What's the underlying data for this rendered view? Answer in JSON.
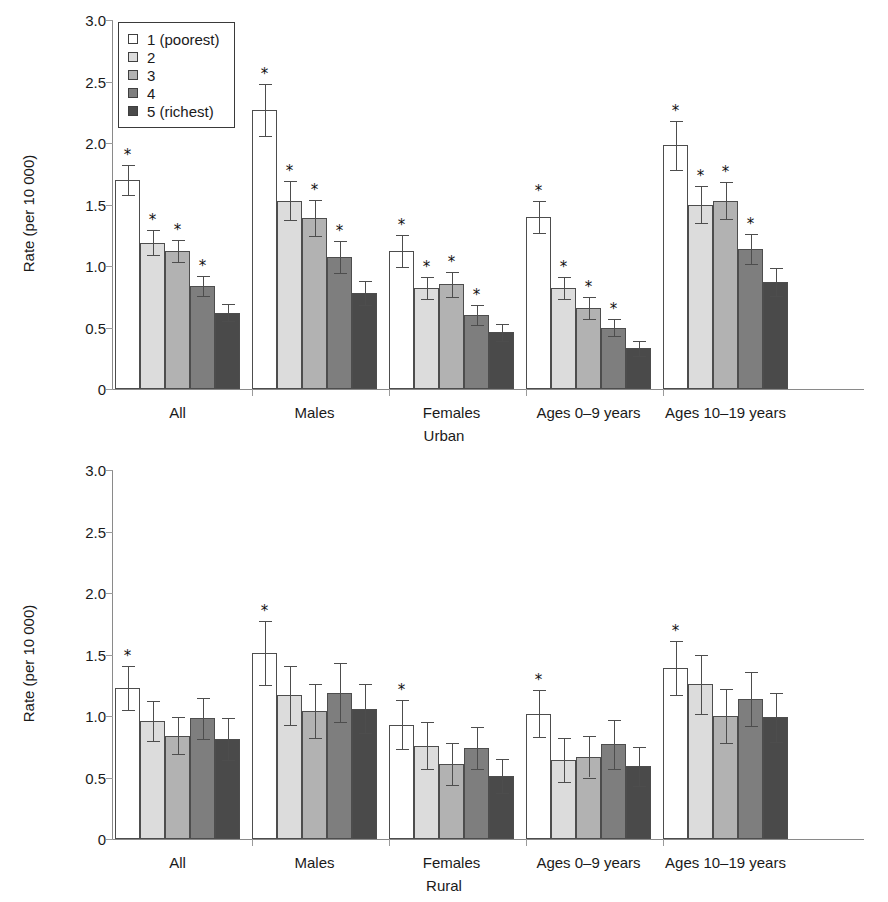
{
  "chart_data": {
    "type": "bar",
    "title": "",
    "ylabel": "Rate (per 10 000)",
    "xlabel": "",
    "ylim": [
      0,
      3.0
    ],
    "ytick_labels": [
      "0",
      "0.5",
      "1.0",
      "1.5",
      "2.0",
      "2.5",
      "3.0"
    ],
    "ytick_values": [
      0,
      0.5,
      1.0,
      1.5,
      2.0,
      2.5,
      3.0
    ],
    "grid": false,
    "legend_position": "top-left",
    "legend_title": "",
    "categories": [
      "All",
      "Males",
      "Females",
      "Ages 0–9 years",
      "Ages 10–19 years"
    ],
    "series_names": [
      "1 (poorest)",
      "2",
      "3",
      "4",
      "5 (richest)"
    ],
    "series_colors": [
      "#ffffff",
      "#dcdcdc",
      "#b2b2b2",
      "#7e7e7e",
      "#4a4a4a"
    ],
    "significance_marker": "*",
    "panels": [
      {
        "name": "Urban",
        "caption": "Urban",
        "ylabel": "Rate (per 10 000)",
        "series": [
          {
            "name": "1 (poorest)",
            "values": [
              1.7,
              2.27,
              1.12,
              1.4,
              1.98
            ],
            "err_low": [
              0.12,
              0.21,
              0.13,
              0.13,
              0.2
            ],
            "err_high": [
              0.12,
              0.21,
              0.13,
              0.13,
              0.2
            ],
            "significant": [
              true,
              true,
              true,
              true,
              true
            ]
          },
          {
            "name": "2",
            "values": [
              1.19,
              1.53,
              0.82,
              0.82,
              1.5
            ],
            "err_low": [
              0.1,
              0.16,
              0.09,
              0.09,
              0.15
            ],
            "err_high": [
              0.1,
              0.16,
              0.09,
              0.09,
              0.15
            ],
            "significant": [
              true,
              true,
              true,
              true,
              true
            ]
          },
          {
            "name": "3",
            "values": [
              1.12,
              1.39,
              0.85,
              0.66,
              1.53
            ],
            "err_low": [
              0.09,
              0.15,
              0.1,
              0.09,
              0.15
            ],
            "err_high": [
              0.09,
              0.15,
              0.1,
              0.09,
              0.15
            ],
            "significant": [
              true,
              true,
              true,
              true,
              true
            ]
          },
          {
            "name": "4",
            "values": [
              0.84,
              1.07,
              0.6,
              0.5,
              1.14
            ],
            "err_low": [
              0.08,
              0.13,
              0.08,
              0.07,
              0.12
            ],
            "err_high": [
              0.08,
              0.13,
              0.08,
              0.07,
              0.12
            ],
            "significant": [
              true,
              true,
              true,
              true,
              true
            ]
          },
          {
            "name": "5 (richest)",
            "values": [
              0.62,
              0.78,
              0.46,
              0.33,
              0.87
            ],
            "err_low": [
              0.07,
              0.1,
              0.07,
              0.06,
              0.11
            ],
            "err_high": [
              0.07,
              0.1,
              0.07,
              0.06,
              0.11
            ],
            "significant": [
              false,
              false,
              false,
              false,
              false
            ]
          }
        ]
      },
      {
        "name": "Rural",
        "caption": "Rural",
        "ylabel": "Rate (per 10 000)",
        "series": [
          {
            "name": "1 (poorest)",
            "values": [
              1.23,
              1.51,
              0.93,
              1.02,
              1.39
            ],
            "err_low": [
              0.18,
              0.26,
              0.2,
              0.19,
              0.22
            ],
            "err_high": [
              0.18,
              0.26,
              0.2,
              0.19,
              0.22
            ],
            "significant": [
              true,
              true,
              true,
              true,
              true
            ]
          },
          {
            "name": "2",
            "values": [
              0.96,
              1.17,
              0.76,
              0.64,
              1.26
            ],
            "err_low": [
              0.16,
              0.24,
              0.19,
              0.18,
              0.24
            ],
            "err_high": [
              0.16,
              0.24,
              0.19,
              0.18,
              0.24
            ],
            "significant": [
              false,
              false,
              false,
              false,
              false
            ]
          },
          {
            "name": "3",
            "values": [
              0.84,
              1.04,
              0.61,
              0.67,
              1.0
            ],
            "err_low": [
              0.15,
              0.22,
              0.17,
              0.17,
              0.22
            ],
            "err_high": [
              0.15,
              0.22,
              0.17,
              0.17,
              0.22
            ],
            "significant": [
              false,
              false,
              false,
              false,
              false
            ]
          },
          {
            "name": "4",
            "values": [
              0.98,
              1.19,
              0.74,
              0.77,
              1.14
            ],
            "err_low": [
              0.17,
              0.24,
              0.17,
              0.2,
              0.22
            ],
            "err_high": [
              0.17,
              0.24,
              0.17,
              0.2,
              0.22
            ],
            "significant": [
              false,
              false,
              false,
              false,
              false
            ]
          },
          {
            "name": "5 (richest)",
            "values": [
              0.81,
              1.06,
              0.51,
              0.59,
              0.99
            ],
            "err_low": [
              0.17,
              0.2,
              0.14,
              0.16,
              0.2
            ],
            "err_high": [
              0.17,
              0.2,
              0.14,
              0.16,
              0.2
            ],
            "significant": [
              false,
              false,
              false,
              false,
              false
            ]
          }
        ]
      }
    ]
  },
  "legend": {
    "items": [
      {
        "label": "1 (poorest)",
        "color": "#ffffff"
      },
      {
        "label": "2",
        "color": "#dcdcdc"
      },
      {
        "label": "3",
        "color": "#b2b2b2"
      },
      {
        "label": "4",
        "color": "#7e7e7e"
      },
      {
        "label": "5 (richest)",
        "color": "#4a4a4a"
      }
    ]
  }
}
